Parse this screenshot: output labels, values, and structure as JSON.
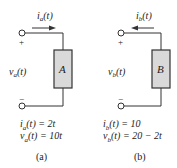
{
  "circuits": [
    {
      "id": "a",
      "element_label": "A",
      "current": {
        "name": "i",
        "sub": "a",
        "arg": "(t)",
        "direction": "right"
      },
      "voltage": {
        "name": "v",
        "sub": "a",
        "arg": "(t)"
      },
      "plus": "+",
      "minus": "−",
      "equations": [
        "i_a(t) = 2t",
        "v_a(t) = 10t"
      ],
      "eq1": {
        "lhs_name": "i",
        "lhs_sub": "a",
        "lhs_arg": "(t) = 2t"
      },
      "eq2": {
        "lhs_name": "v",
        "lhs_sub": "a",
        "lhs_arg": "(t) = 10t"
      },
      "caption": "(a)"
    },
    {
      "id": "b",
      "element_label": "B",
      "current": {
        "name": "i",
        "sub": "b",
        "arg": "(t)",
        "direction": "left"
      },
      "voltage": {
        "name": "v",
        "sub": "b",
        "arg": "(t)"
      },
      "plus": "+",
      "minus": "−",
      "equations": [
        "i_b(t) = 10",
        "v_b(t) = 20 − 2t"
      ],
      "eq1": {
        "lhs_name": "i",
        "lhs_sub": "b",
        "lhs_arg": "(t) = 10"
      },
      "eq2": {
        "lhs_name": "v",
        "lhs_sub": "b",
        "lhs_arg": "(t) = 20 − 2t"
      },
      "caption": "(b)"
    }
  ],
  "colors": {
    "element_fill": "#d9d9d9",
    "line": "#333333"
  }
}
